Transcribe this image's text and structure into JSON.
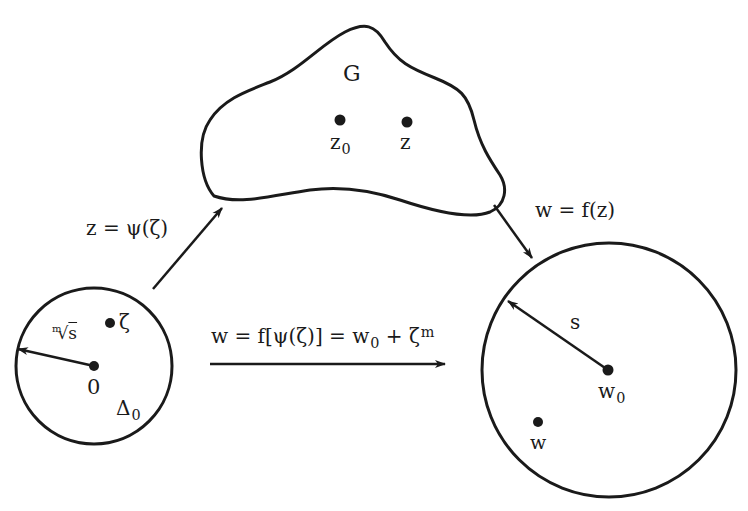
{
  "colors": {
    "stroke": "#1a1a1a",
    "background": "#ffffff"
  },
  "domain_G": {
    "label": "G",
    "points": [
      {
        "name": "z0",
        "base": "z",
        "sub": "0"
      },
      {
        "name": "z",
        "base": "z",
        "sub": ""
      }
    ]
  },
  "disk_left": {
    "label_base": "Δ",
    "label_sub": "0",
    "center_label": "0",
    "point_label": "ζ",
    "radius_label_index": "m",
    "radius_label_radical": "√",
    "radius_label_radicand": "s"
  },
  "disk_right": {
    "center_label_base": "w",
    "center_label_sub": "0",
    "point_label": "w",
    "radius_label": "s"
  },
  "maps": {
    "psi": "z =  ψ(ζ)",
    "f": "w = f(z)",
    "composite_prefix": "w = f[ψ(ζ)] = w",
    "composite_sub": "0",
    "composite_mid": "+ ζ",
    "composite_sup": "m"
  }
}
